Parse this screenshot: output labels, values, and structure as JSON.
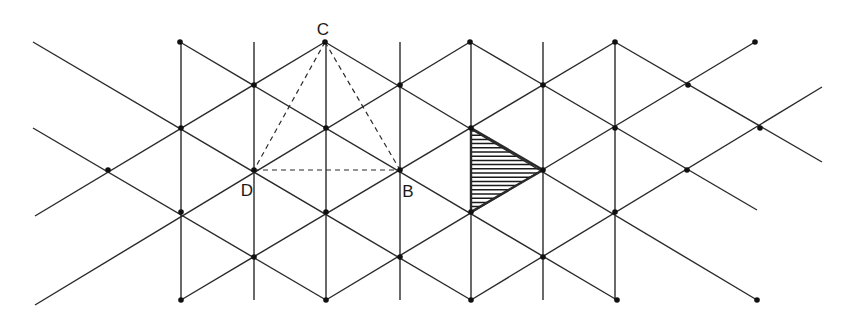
{
  "diagram": {
    "colors": {
      "line": "#2a2a2a",
      "background": "#ffffff",
      "hatch": "#1a1a1a"
    },
    "labels": [
      {
        "id": "C",
        "text": "C",
        "x": 323,
        "y": 29
      },
      {
        "id": "D",
        "text": "D",
        "x": 247,
        "y": 190
      },
      {
        "id": "B",
        "text": "B",
        "x": 408,
        "y": 191
      }
    ],
    "vertical_lines": [
      {
        "x": 181,
        "y1": 42,
        "y2": 300
      },
      {
        "x": 254,
        "y1": 42,
        "y2": 300
      },
      {
        "x": 326,
        "y1": 42,
        "y2": 300
      },
      {
        "x": 400,
        "y1": 42,
        "y2": 300
      },
      {
        "x": 471,
        "y1": 42,
        "y2": 300
      },
      {
        "x": 543,
        "y1": 42,
        "y2": 300
      },
      {
        "x": 615,
        "y1": 42,
        "y2": 300
      }
    ],
    "diagonal_lines": [
      {
        "x1": 33,
        "y1": 42,
        "x2": 471,
        "y2": 300
      },
      {
        "x1": 33,
        "y1": 128,
        "x2": 326,
        "y2": 300
      },
      {
        "x1": 180,
        "y1": 42,
        "x2": 617,
        "y2": 300
      },
      {
        "x1": 325,
        "y1": 42,
        "x2": 757,
        "y2": 300
      },
      {
        "x1": 470,
        "y1": 42,
        "x2": 757,
        "y2": 210
      },
      {
        "x1": 615,
        "y1": 42,
        "x2": 822,
        "y2": 162
      },
      {
        "x1": 35,
        "y1": 305,
        "x2": 470,
        "y2": 42
      },
      {
        "x1": 35,
        "y1": 216,
        "x2": 325,
        "y2": 42
      },
      {
        "x1": 181,
        "y1": 300,
        "x2": 615,
        "y2": 42
      },
      {
        "x1": 326,
        "y1": 300,
        "x2": 755,
        "y2": 42
      },
      {
        "x1": 471,
        "y1": 300,
        "x2": 822,
        "y2": 87
      }
    ],
    "dashed_lines": [
      {
        "from": "C",
        "x1": 325,
        "y1": 42,
        "x2": 254,
        "y2": 170
      },
      {
        "from": "C",
        "x1": 325,
        "y1": 42,
        "x2": 400,
        "y2": 170
      },
      {
        "from": "D",
        "x1": 254,
        "y1": 170,
        "x2": 400,
        "y2": 170
      }
    ],
    "shaded_triangle": {
      "points": [
        [
          471,
          128
        ],
        [
          543,
          170
        ],
        [
          471,
          212
        ]
      ]
    },
    "dots": [
      [
        180,
        42
      ],
      [
        325,
        42
      ],
      [
        470,
        42
      ],
      [
        615,
        42
      ],
      [
        755,
        42
      ],
      [
        254,
        85
      ],
      [
        400,
        85
      ],
      [
        543,
        85
      ],
      [
        688,
        85
      ],
      [
        181,
        128
      ],
      [
        326,
        128
      ],
      [
        471,
        128
      ],
      [
        615,
        128
      ],
      [
        760,
        128
      ],
      [
        108,
        170
      ],
      [
        254,
        170
      ],
      [
        400,
        170
      ],
      [
        543,
        170
      ],
      [
        687,
        170
      ],
      [
        181,
        212
      ],
      [
        326,
        212
      ],
      [
        471,
        212
      ],
      [
        615,
        212
      ],
      [
        254,
        257
      ],
      [
        400,
        257
      ],
      [
        543,
        257
      ],
      [
        181,
        300
      ],
      [
        326,
        300
      ],
      [
        471,
        300
      ],
      [
        617,
        300
      ],
      [
        757,
        300
      ]
    ]
  }
}
